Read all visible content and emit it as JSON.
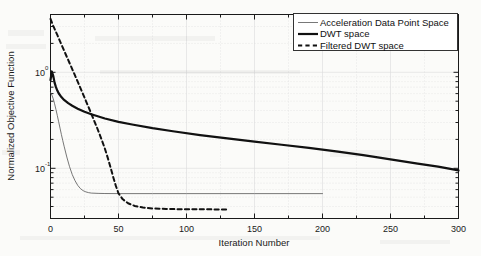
{
  "chart_data": {
    "type": "line",
    "title": "",
    "xlabel": "Iteration Number",
    "ylabel": "Normalized Objective Function",
    "xlim": [
      0,
      300
    ],
    "ylim": [
      0.03,
      4.0
    ],
    "yscale": "log",
    "xscale": "linear",
    "grid": true,
    "legend_position": "top-right",
    "xticks": [
      "0",
      "50",
      "100",
      "150",
      "200",
      "250",
      "300"
    ],
    "xtick_values": [
      0,
      50,
      100,
      150,
      200,
      250,
      300
    ],
    "yticks": [
      "10^0",
      "10^-1"
    ],
    "ytick_values": [
      1,
      0.1
    ],
    "ytick_mantissa": [
      "10",
      "10"
    ],
    "ytick_exponent": [
      "0",
      "-1"
    ],
    "series": [
      {
        "name": "Acceleration Data Point Space",
        "style": "thin-solid",
        "color": "#555555",
        "width": 0.8,
        "x": [
          0,
          1,
          2,
          3,
          4,
          5,
          6,
          7,
          8,
          9,
          10,
          12,
          14,
          16,
          18,
          20,
          22,
          24,
          26,
          28,
          30,
          35,
          40,
          50,
          75,
          100,
          150,
          200
        ],
        "y": [
          0.62,
          0.58,
          0.53,
          0.47,
          0.41,
          0.355,
          0.305,
          0.262,
          0.225,
          0.195,
          0.17,
          0.131,
          0.104,
          0.086,
          0.0745,
          0.0665,
          0.0615,
          0.0585,
          0.0568,
          0.0558,
          0.0552,
          0.0548,
          0.0546,
          0.0545,
          0.0545,
          0.0545,
          0.0545,
          0.0545
        ]
      },
      {
        "name": "DWT space",
        "style": "thick-solid",
        "color": "#111111",
        "width": 2.2,
        "x": [
          0,
          1,
          2,
          3,
          4,
          5,
          6,
          8,
          10,
          13,
          16,
          20,
          25,
          30,
          40,
          50,
          60,
          75,
          90,
          110,
          130,
          150,
          170,
          190,
          210,
          230,
          250,
          270,
          285,
          300
        ],
        "y": [
          0.83,
          1.02,
          0.92,
          0.78,
          0.7,
          0.645,
          0.605,
          0.552,
          0.515,
          0.477,
          0.448,
          0.418,
          0.388,
          0.366,
          0.33,
          0.305,
          0.286,
          0.262,
          0.243,
          0.222,
          0.205,
          0.19,
          0.176,
          0.163,
          0.15,
          0.137,
          0.124,
          0.112,
          0.104,
          0.095
        ]
      },
      {
        "name": "Filtered DWT space",
        "style": "dashed",
        "color": "#111111",
        "width": 2.0,
        "x": [
          0,
          2,
          5,
          8,
          11,
          14,
          17,
          20,
          23,
          26,
          29,
          32,
          34,
          36,
          38,
          40,
          42,
          44,
          46,
          48,
          50,
          53,
          57,
          62,
          68,
          75,
          85,
          95,
          110,
          125,
          130
        ],
        "y": [
          3.6,
          3.05,
          2.45,
          1.95,
          1.56,
          1.25,
          1.0,
          0.8,
          0.635,
          0.505,
          0.4,
          0.315,
          0.27,
          0.228,
          0.192,
          0.16,
          0.13,
          0.104,
          0.082,
          0.066,
          0.0548,
          0.0478,
          0.0432,
          0.0405,
          0.039,
          0.0382,
          0.0377,
          0.0375,
          0.0374,
          0.0373,
          0.0373
        ]
      }
    ]
  },
  "legend": {
    "items": [
      {
        "label": "Acceleration Data Point Space",
        "style": "thin-solid"
      },
      {
        "label": "DWT space",
        "style": "thick-solid"
      },
      {
        "label": "Filtered DWT space",
        "style": "dashed"
      }
    ]
  },
  "colors": {
    "background": "#fbfbf9",
    "axis": "#1a1a1a",
    "grid": "#d8d8d8",
    "legend_border": "#333333",
    "legend_fill": "#ffffff"
  }
}
